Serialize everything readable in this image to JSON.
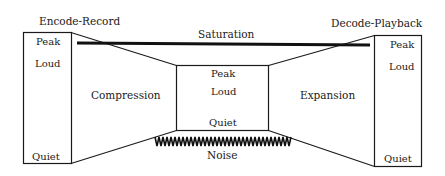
{
  "diagram": {
    "encode_title": "Encode-Record",
    "decode_title": "Decode-Playback",
    "saturation_label": "Saturation",
    "noise_label": "Noise",
    "compression_label": "Compression",
    "expansion_label": "Expansion",
    "left_box": {
      "peak": "Peak",
      "loud": "Loud",
      "quiet": "Quiet"
    },
    "middle_box": {
      "peak": "Peak",
      "loud": "Loud",
      "quiet": "Quiet"
    },
    "right_box": {
      "peak": "Peak",
      "loud": "Loud",
      "quiet": "Quiet"
    },
    "colors": {
      "stroke": "#1a1a1a",
      "background": "#ffffff"
    }
  }
}
